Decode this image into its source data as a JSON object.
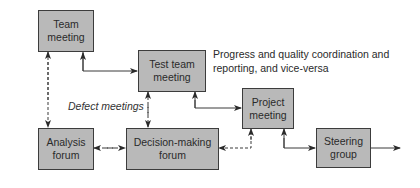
{
  "diagram": {
    "nodes": {
      "team_meeting": {
        "label": "Team\nmeeting"
      },
      "test_team_meeting": {
        "label": "Test team\nmeeting"
      },
      "project_meeting": {
        "label": "Project\nmeeting"
      },
      "analysis_forum": {
        "label": "Analysis\nforum"
      },
      "decision_forum": {
        "label": "Decision-making\nforum"
      },
      "steering_group": {
        "label": "Steering\ngroup"
      }
    },
    "annotations": {
      "progress_note": "Progress and quality coordination and\nreporting, and vice-versa",
      "defect_meetings": "Defect meetings"
    },
    "edges": [
      {
        "from": "team_meeting",
        "to": "test_team_meeting",
        "style": "solid",
        "direction": "both"
      },
      {
        "from": "team_meeting",
        "to": "analysis_forum",
        "style": "dashed",
        "direction": "both"
      },
      {
        "from": "test_team_meeting",
        "to": "decision_forum",
        "style": "dashed",
        "direction": "both",
        "label": "Defect meetings"
      },
      {
        "from": "test_team_meeting",
        "to": "project_meeting",
        "style": "solid",
        "direction": "both"
      },
      {
        "from": "analysis_forum",
        "to": "decision_forum",
        "style": "dashed",
        "direction": "both"
      },
      {
        "from": "project_meeting",
        "to": "decision_forum",
        "style": "dashed",
        "direction": "both"
      },
      {
        "from": "project_meeting",
        "to": "steering_group",
        "style": "solid",
        "direction": "both"
      },
      {
        "from": "steering_group",
        "to": "outside",
        "style": "solid",
        "direction": "forward"
      }
    ],
    "colors": {
      "box_fill": "#b9b9b9",
      "box_border": "#3c3c3c",
      "line": "#3a3a3a"
    }
  }
}
